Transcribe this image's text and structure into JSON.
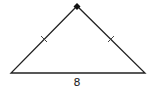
{
  "diagram": {
    "type": "isosceles-right-triangle",
    "vertices": {
      "apex": [
        77,
        6
      ],
      "left": [
        11,
        73
      ],
      "right": [
        145,
        73
      ]
    },
    "right_angle_marker": "apex",
    "congruent_legs": [
      "left-leg",
      "right-leg"
    ],
    "base_label": "8",
    "colors": {
      "stroke": "#222222",
      "background": "#ffffff"
    }
  }
}
